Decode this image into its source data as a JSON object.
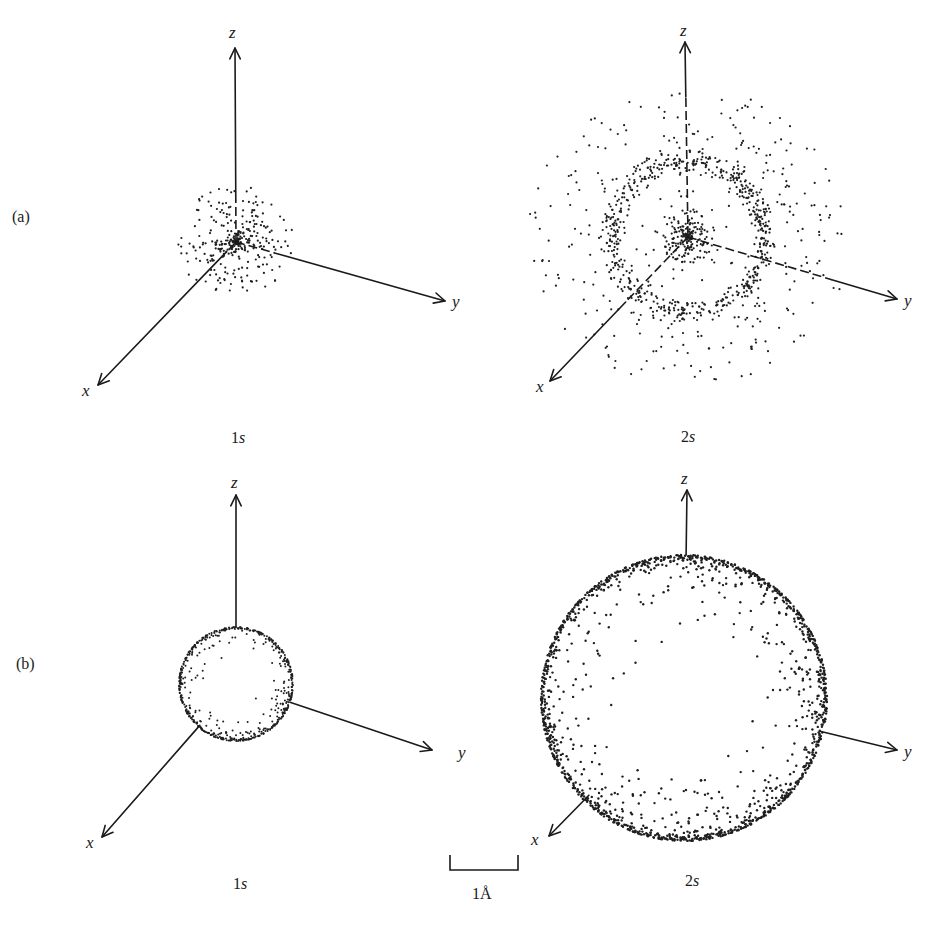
{
  "figure": {
    "row_labels": [
      "(a)",
      "(b)"
    ],
    "panels": [
      {
        "id": "a-1s",
        "row": "(a)",
        "orbital": "1s",
        "representation": "electron-density-dot-cloud",
        "description": "dense cloud concentrated at nucleus, falling off with distance"
      },
      {
        "id": "a-2s",
        "row": "(a)",
        "orbital": "2s",
        "representation": "electron-density-dot-cloud",
        "description": "dense inner core, node, then outer dense ring and sparse outer region"
      },
      {
        "id": "b-1s",
        "row": "(b)",
        "orbital": "1s",
        "representation": "boundary-surface-sphere",
        "description": "small sphere enclosing most of electron density"
      },
      {
        "id": "b-2s",
        "row": "(b)",
        "orbital": "2s",
        "representation": "boundary-surface-sphere",
        "description": "larger sphere enclosing most of electron density"
      }
    ],
    "axis_labels": {
      "x": "x",
      "y": "y",
      "z": "z"
    },
    "orbital_labels": {
      "one_s_num": "1",
      "two_s_num": "2",
      "s_letter": "s"
    },
    "scale_bar": {
      "label": "1Å",
      "length_angstrom": 1
    }
  }
}
